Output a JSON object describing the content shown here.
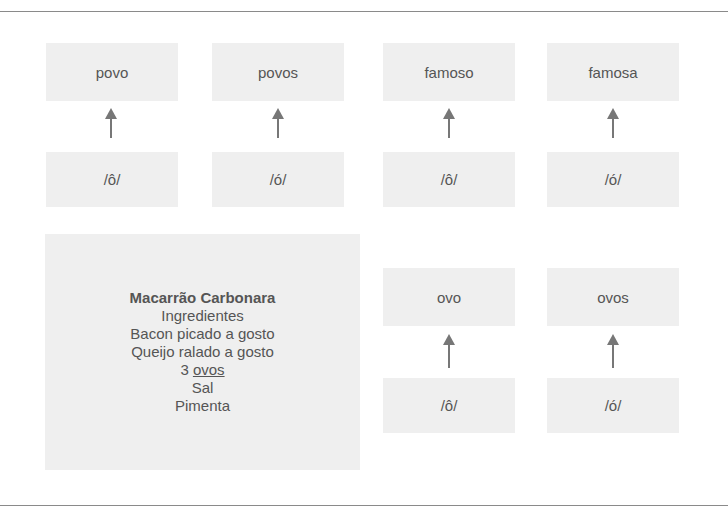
{
  "diagram": {
    "top_row": [
      {
        "word": "povo",
        "phoneme": "/ô/"
      },
      {
        "word": "povos",
        "phoneme": "/ó/"
      },
      {
        "word": "famoso",
        "phoneme": "/ô/"
      },
      {
        "word": "famosa",
        "phoneme": "/ó/"
      }
    ],
    "bottom_row": [
      {
        "word": "ovo",
        "phoneme": "/ô/"
      },
      {
        "word": "ovos",
        "phoneme": "/ó/"
      }
    ],
    "arrow_icon": "arrow-up-icon"
  },
  "recipe": {
    "title": "Macarrão Carbonara",
    "subtitle": "Ingredientes",
    "items": [
      {
        "text": "Bacon picado a gosto"
      },
      {
        "text": "Queijo ralado a gosto"
      },
      {
        "prefix": "3 ",
        "highlight": "ovos"
      },
      {
        "text": "Sal"
      },
      {
        "text": "Pimenta"
      }
    ]
  },
  "colors": {
    "box_fill": "#efefef",
    "text": "#555555",
    "arrow": "#777777",
    "rule": "#8a8a8a"
  }
}
